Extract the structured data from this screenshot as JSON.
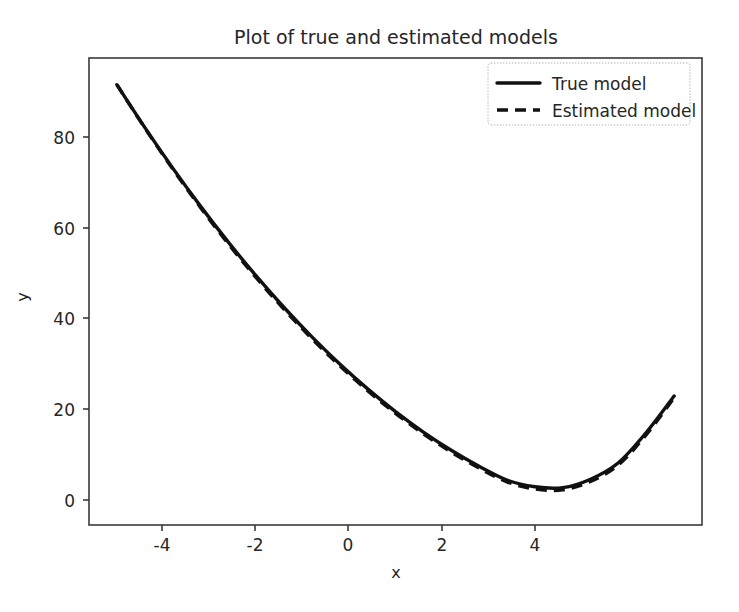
{
  "figure": {
    "background_color": "#ffffff",
    "foreground_color": "#262626",
    "line_color": "#111111"
  },
  "chart_data": {
    "type": "line",
    "title": "Plot of true and estimated models",
    "xlabel": "x",
    "ylabel": "y",
    "xlim": [
      -5.5,
      5.5
    ],
    "ylim": [
      -8.0,
      97.0
    ],
    "grid": false,
    "legend_position": "upper right",
    "xticks": [
      -4,
      -2,
      0,
      2,
      4
    ],
    "xticklabels": [
      "-4",
      "-2",
      "0",
      "2",
      "4"
    ],
    "yticks": [
      0,
      20,
      40,
      60,
      80
    ],
    "yticklabels": [
      "0",
      "20",
      "40",
      "60",
      "80"
    ],
    "x": [
      -5.0,
      -4.5,
      -4.0,
      -3.5,
      -3.0,
      -2.5,
      -2.0,
      -1.5,
      -1.0,
      -0.5,
      0.0,
      0.5,
      1.0,
      1.5,
      2.0,
      2.5,
      3.0,
      3.5,
      4.0,
      4.5,
      5.0
    ],
    "series": [
      {
        "name": "True model",
        "linestyle": "solid",
        "color": "#111111",
        "values": [
          91.0,
          81.4,
          72.3,
          63.7,
          55.6,
          48.0,
          40.9,
          34.3,
          28.2,
          22.6,
          17.5,
          12.9,
          8.8,
          5.2,
          2.1,
          0.6,
          0.4,
          2.3,
          6.0,
          12.8,
          21.0
        ]
      },
      {
        "name": "Estimated model",
        "linestyle": "dashed",
        "color": "#111111",
        "values": [
          91.0,
          81.3,
          72.1,
          63.4,
          55.2,
          47.6,
          40.5,
          33.9,
          27.8,
          22.2,
          17.1,
          12.5,
          8.4,
          4.8,
          1.7,
          0.1,
          -0.1,
          1.8,
          5.5,
          12.3,
          20.6
        ]
      }
    ],
    "legend_entries": [
      {
        "label": "True model",
        "linestyle": "solid"
      },
      {
        "label": "Estimated model",
        "linestyle": "dashed"
      }
    ]
  }
}
